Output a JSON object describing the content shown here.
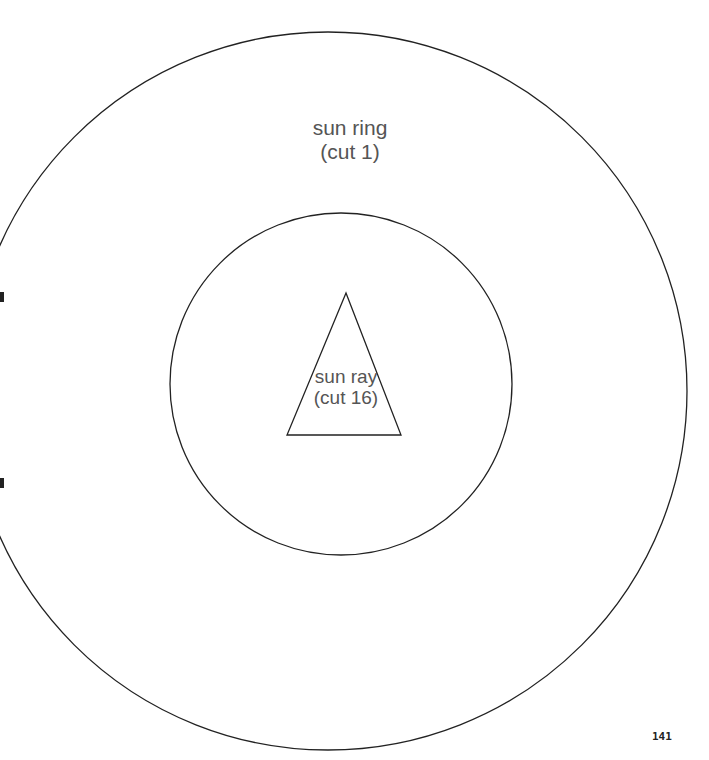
{
  "pattern": {
    "outer_circle": {
      "name": "sun ring",
      "cx": 328,
      "cy": 391,
      "r": 359
    },
    "inner_circle": {
      "cx": 341,
      "cy": 384,
      "r": 171
    },
    "triangle": {
      "points": "346,293 287,435 401,435"
    },
    "stroke_color": "#222222"
  },
  "labels": {
    "sun_ring_line1": "sun ring",
    "sun_ring_line2": "(cut 1)",
    "sun_ray_line1": "sun ray",
    "sun_ray_line2": "(cut 16)"
  },
  "page": {
    "number": "141"
  }
}
